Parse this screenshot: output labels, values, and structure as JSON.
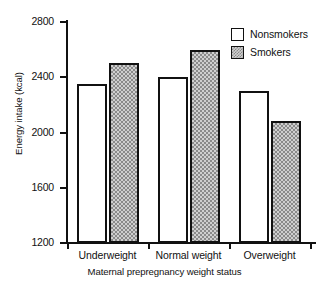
{
  "chart_data": {
    "type": "bar",
    "title": "",
    "xlabel": "Maternal prepregnancy weight status",
    "ylabel": "Energy intake (kcal)",
    "categories": [
      "Underweight",
      "Normal weight",
      "Overweight"
    ],
    "series": [
      {
        "name": "Nonsmokers",
        "values": [
          2350,
          2400,
          2300
        ],
        "fill": "white",
        "color": "#ffffff"
      },
      {
        "name": "Smokers",
        "values": [
          2500,
          2600,
          2080
        ],
        "fill": "gray-checkered",
        "color": "#cfcfcf"
      }
    ],
    "ylim": [
      1200,
      2800
    ],
    "yticks": [
      1200,
      1600,
      2000,
      2400,
      2800
    ],
    "ytick_labels": [
      "1200",
      "1600",
      "2000",
      "2400",
      "2800"
    ],
    "grid": false,
    "legend_position": "top-right",
    "axis_color": "#111111"
  },
  "legend": {
    "entries": [
      {
        "label": "Nonsmokers"
      },
      {
        "label": "Smokers"
      }
    ]
  }
}
